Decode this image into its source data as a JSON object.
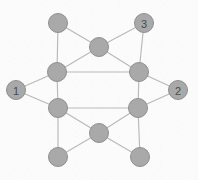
{
  "figure": {
    "width": 198,
    "height": 180,
    "background_color": "#fbfbfb",
    "node_fill_color": "#a9a9a9",
    "node_stroke_color": "#8f8f8f",
    "edge_color": "#b9b9b9",
    "label_color": "#4a4a4a",
    "node_radius": 9.5,
    "labeled_node_radius": 9.5
  },
  "chart_data": {
    "type": "diagram",
    "title": "",
    "nodes": [
      {
        "id": "n1",
        "name": "top-left-outer",
        "x": 58,
        "y": 23,
        "label": "",
        "r": 9.5
      },
      {
        "id": "n2",
        "name": "top-right-outer",
        "x": 144,
        "y": 23,
        "label": "3",
        "r": 9.5
      },
      {
        "id": "n3",
        "name": "hex-top",
        "x": 99,
        "y": 47,
        "label": "",
        "r": 9.5
      },
      {
        "id": "n4",
        "name": "hex-upper-left",
        "x": 57,
        "y": 72,
        "label": "",
        "r": 9.5
      },
      {
        "id": "n5",
        "name": "hex-upper-right",
        "x": 139,
        "y": 72,
        "label": "",
        "r": 9.5
      },
      {
        "id": "n6",
        "name": "left-outer",
        "x": 16,
        "y": 90,
        "label": "1",
        "r": 9.5
      },
      {
        "id": "n7",
        "name": "right-outer",
        "x": 178,
        "y": 90,
        "label": "2",
        "r": 9.5
      },
      {
        "id": "n8",
        "name": "hex-lower-left",
        "x": 58,
        "y": 108,
        "label": "",
        "r": 9.5
      },
      {
        "id": "n9",
        "name": "hex-lower-right",
        "x": 138,
        "y": 108,
        "label": "",
        "r": 9.5
      },
      {
        "id": "n10",
        "name": "hex-bottom",
        "x": 99,
        "y": 133,
        "label": "",
        "r": 9.5
      },
      {
        "id": "n11",
        "name": "bottom-left-outer",
        "x": 58,
        "y": 157,
        "label": "",
        "r": 9.5
      },
      {
        "id": "n12",
        "name": "bottom-right-outer",
        "x": 140,
        "y": 157,
        "label": "",
        "r": 9.5
      }
    ],
    "edges": [
      {
        "from": "n1",
        "to": "n3"
      },
      {
        "from": "n1",
        "to": "n4"
      },
      {
        "from": "n2",
        "to": "n3"
      },
      {
        "from": "n2",
        "to": "n5"
      },
      {
        "from": "n3",
        "to": "n4"
      },
      {
        "from": "n3",
        "to": "n5"
      },
      {
        "from": "n4",
        "to": "n5"
      },
      {
        "from": "n4",
        "to": "n6"
      },
      {
        "from": "n4",
        "to": "n8"
      },
      {
        "from": "n5",
        "to": "n7"
      },
      {
        "from": "n5",
        "to": "n9"
      },
      {
        "from": "n6",
        "to": "n8"
      },
      {
        "from": "n7",
        "to": "n9"
      },
      {
        "from": "n8",
        "to": "n9"
      },
      {
        "from": "n8",
        "to": "n10"
      },
      {
        "from": "n8",
        "to": "n11"
      },
      {
        "from": "n9",
        "to": "n10"
      },
      {
        "from": "n9",
        "to": "n12"
      },
      {
        "from": "n10",
        "to": "n11"
      },
      {
        "from": "n10",
        "to": "n12"
      }
    ],
    "labels": [
      {
        "text": "1",
        "node": "n6"
      },
      {
        "text": "2",
        "node": "n7"
      },
      {
        "text": "3",
        "node": "n2"
      }
    ]
  }
}
